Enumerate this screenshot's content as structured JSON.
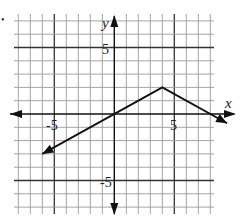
{
  "chart_data": {
    "type": "line",
    "title": "",
    "xlabel": "x",
    "ylabel": "y",
    "xlim": [
      -8,
      8
    ],
    "ylim": [
      -7,
      7
    ],
    "grid": true,
    "tick_labels": {
      "x": [
        {
          "value": -5,
          "label": "-5"
        },
        {
          "value": 5,
          "label": "5"
        }
      ],
      "y": [
        {
          "value": 5,
          "label": "5"
        },
        {
          "value": -5,
          "label": "-5"
        }
      ]
    },
    "series": [
      {
        "name": "piecewise linear graph",
        "points": [
          [
            -6,
            -3
          ],
          [
            4,
            2
          ],
          [
            9.4,
            -0.7
          ]
        ],
        "vertex": [
          4,
          2
        ],
        "arrow_ends": [
          "left",
          "right"
        ],
        "description": "Rises with slope 1/2 from (-6,-3) through (0,0) to vertex (4,2), then falls with slope -1/2"
      }
    ],
    "legend": null
  },
  "page": {
    "bullet": "•",
    "axis_x_label": "x",
    "axis_y_label": "y",
    "tick_x_neg5": "-5",
    "tick_x_pos5": "5",
    "tick_y_pos5": "5",
    "tick_y_neg5": "-5"
  },
  "colors": {
    "grid_minor": "#9a9a9a",
    "grid_major": "#333333",
    "axis": "#111111",
    "line": "#111111",
    "background": "#ffffff"
  }
}
